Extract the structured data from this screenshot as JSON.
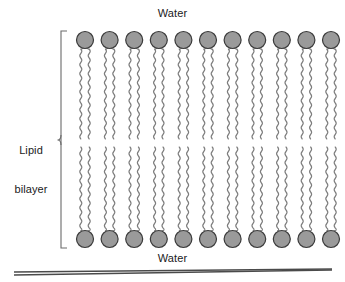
{
  "figure": {
    "title_top": "Water",
    "title_bottom": "Water",
    "bilayer_label_line1": "Lipid",
    "bilayer_label_line2": "bilayer",
    "width": 345,
    "height": 282
  },
  "labels": {
    "water_top": "Water",
    "water_bottom": "Water",
    "lipid_bilayer": "Lipid bilayer",
    "lipid_line_1": "Lipid",
    "lipid_line_2": "bilayer"
  },
  "colors": {
    "head_fill": "#9a9a9a",
    "head_stroke": "#3a3a3a",
    "tail_stroke": "#7d7d7d",
    "bracket_stroke": "#6b6b6b",
    "baseline_stroke": "#4a4a4a",
    "text": "#1a1a1a",
    "background": "#ffffff"
  },
  "structure": {
    "leaflets": 2,
    "lipids_per_leaflet": 11,
    "tails_per_lipid": 2,
    "head_radius": 8.5,
    "head_row_top_y": 40,
    "head_row_bottom_y": 239,
    "first_head_cx": 85,
    "head_spacing": 24.6,
    "upper_tail_top_y": 49,
    "upper_tail_bottom_y": 139,
    "lower_tail_top_y": 147,
    "lower_tail_bottom_y": 231,
    "tail_offset_x": 4.2,
    "wave_amplitude": 2.1,
    "wave_period": 9
  },
  "bracket": {
    "x": 61,
    "top_y": 31,
    "bottom_y": 248,
    "tick_length": 6,
    "midpoint_y": 140
  },
  "baseline": {
    "line1": {
      "x1": 14,
      "y1": 272,
      "x2": 332,
      "y2": 269
    },
    "line2": {
      "x1": 14,
      "y1": 275,
      "x2": 332,
      "y2": 270
    }
  }
}
